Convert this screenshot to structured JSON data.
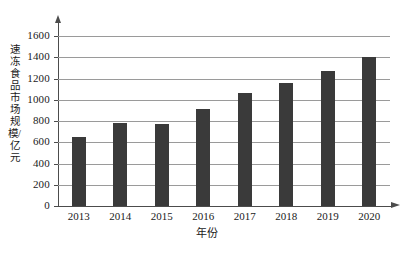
{
  "chart_data": {
    "type": "bar",
    "title": "",
    "xlabel": "年份",
    "ylabel": "速冻食品市场规模/亿元",
    "categories": [
      "2013",
      "2014",
      "2015",
      "2016",
      "2017",
      "2018",
      "2019",
      "2020"
    ],
    "values": [
      650,
      780,
      775,
      910,
      1060,
      1160,
      1275,
      1400
    ],
    "series": [
      {
        "name": "速冻食品市场规模",
        "values": [
          650,
          780,
          775,
          910,
          1060,
          1160,
          1275,
          1400
        ]
      }
    ],
    "ylim": [
      0,
      1600
    ],
    "ytick_labels": [
      "0",
      "200",
      "400",
      "600",
      "800",
      "1000",
      "1200",
      "1400",
      "1600"
    ],
    "ytick_values": [
      0,
      200,
      400,
      600,
      800,
      1000,
      1200,
      1400,
      1600
    ],
    "grid": "horizontal",
    "legend": "none",
    "bar_color": "#3a3a3a",
    "axis_color": "#4c4c4c",
    "gridline_color": "#9a9a9a",
    "background_color": "#ffffff"
  }
}
